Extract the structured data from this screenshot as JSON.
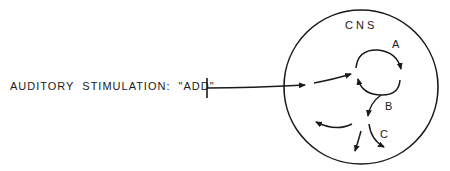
{
  "diagram": {
    "stimulus_label": "AUDITORY STIMULATION: \"ADD\"",
    "region_label": "CNS",
    "pathway_labels": {
      "a": "A",
      "b": "B",
      "c": "C"
    },
    "colors": {
      "stroke": "#1a1a1a",
      "background": "#ffffff"
    }
  }
}
